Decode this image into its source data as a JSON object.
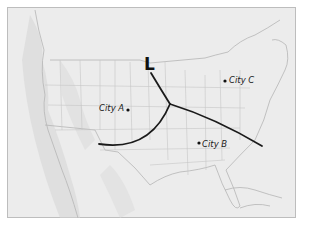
{
  "map": {
    "title": "",
    "pressure_system": {
      "symbol": "L",
      "type": "low-pressure",
      "x": 144,
      "y": 56
    },
    "cities": [
      {
        "name": "City A",
        "dot": [
          128,
          110
        ],
        "label_pos": [
          100,
          104
        ],
        "label_side": "left"
      },
      {
        "name": "City B",
        "dot": [
          199,
          143
        ],
        "label_pos": [
          202,
          140
        ],
        "label_side": "right"
      },
      {
        "name": "City C",
        "dot": [
          225,
          81
        ],
        "label_pos": [
          229,
          76
        ],
        "label_side": "right"
      }
    ],
    "fronts": [
      {
        "name": "occluded-front",
        "path": "M151,73 Q160,88 170,104"
      },
      {
        "name": "warm-front",
        "path": "M170,104 Q215,118 262,146"
      },
      {
        "name": "cold-front",
        "path": "M170,104 Q150,152 99,144"
      }
    ],
    "colors": {
      "land": "#ececec",
      "border": "#bdbdbd",
      "state_lines": "#c4c4c4",
      "front_lines": "#1a1a1a",
      "text": "#1a1a1a"
    }
  }
}
